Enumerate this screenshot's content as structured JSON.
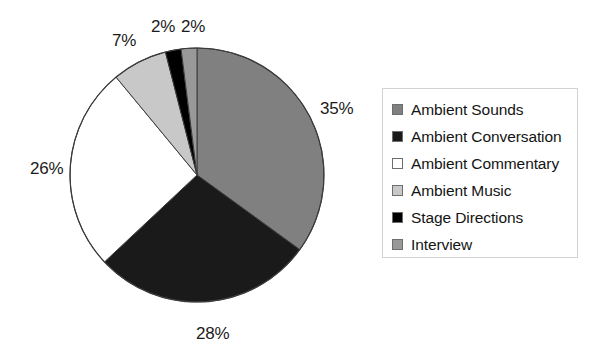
{
  "chart_data": {
    "type": "pie",
    "title": "",
    "labels": [
      "Ambient Sounds",
      "Ambient Conversation",
      "Ambient Commentary",
      "Ambient Music",
      "Stage Directions",
      "Interview"
    ],
    "values": [
      35,
      28,
      26,
      7,
      2,
      2
    ],
    "value_labels": [
      "35%",
      "28%",
      "26%",
      "7%",
      "2%",
      "2%"
    ],
    "colors": [
      "#808080",
      "#1a1a1a",
      "#ffffff",
      "#c8c8c8",
      "#000000",
      "#999999"
    ],
    "start_angle_deg": 0,
    "direction": "clockwise",
    "legend_position": "right",
    "grid": false,
    "labels_outside": true
  },
  "pie": {
    "center_x": 197,
    "center_y": 175,
    "radius": 127,
    "outline_color": "#3c3c3c",
    "slice_labels": [
      {
        "text": "35%",
        "left": 320,
        "top": 99
      },
      {
        "text": "28%",
        "left": 196,
        "top": 324
      },
      {
        "text": "26%",
        "left": 30,
        "top": 159
      },
      {
        "text": "7%",
        "left": 112,
        "top": 31
      },
      {
        "text": "2%",
        "left": 151,
        "top": 17
      },
      {
        "text": "2%",
        "left": 181,
        "top": 17
      }
    ]
  },
  "legend": {
    "items": [
      {
        "label": "Ambient Sounds",
        "color": "#808080"
      },
      {
        "label": "Ambient Conversation",
        "color": "#1a1a1a"
      },
      {
        "label": "Ambient Commentary",
        "color": "#ffffff"
      },
      {
        "label": "Ambient Music",
        "color": "#c8c8c8"
      },
      {
        "label": "Stage Directions",
        "color": "#000000"
      },
      {
        "label": "Interview",
        "color": "#999999"
      }
    ]
  }
}
